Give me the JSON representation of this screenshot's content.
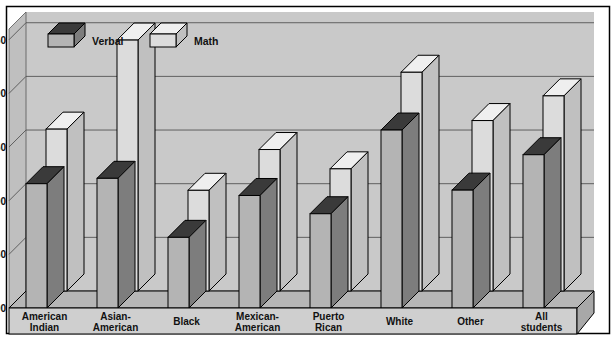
{
  "chart_data": {
    "type": "bar",
    "title": "",
    "subtitle": "",
    "xlabel": "",
    "ylabel": "",
    "ylim": [
      300,
      560
    ],
    "yticks": [
      300,
      350,
      400,
      450,
      500,
      550
    ],
    "ytick_labels": [
      "300",
      "350",
      "400",
      "450",
      "500",
      "550"
    ],
    "grid": true,
    "legend_position": "top-left",
    "style": "3d-block-bars",
    "categories": [
      "American\nIndian",
      "Asian-\nAmerican",
      "Black",
      "Mexican-\nAmerican",
      "Puerto\nRican",
      "White",
      "Other",
      "All\nstudents"
    ],
    "category_labels": [
      [
        "American",
        "Indian"
      ],
      [
        "Asian-",
        "American"
      ],
      [
        "Black",
        ""
      ],
      [
        "Mexican-",
        "American"
      ],
      [
        "Puerto",
        "Rican"
      ],
      [
        "White",
        ""
      ],
      [
        "Other",
        ""
      ],
      [
        "All",
        "students"
      ]
    ],
    "series": [
      {
        "name": "Verbal",
        "color": "#9a9a9a",
        "values": [
          400,
          405,
          350,
          389,
          372,
          450,
          394,
          427
        ]
      },
      {
        "name": "Math",
        "color": "#d6d6d6",
        "values": [
          435,
          518,
          378,
          416,
          398,
          488,
          443,
          466
        ]
      }
    ]
  },
  "legend": {
    "items": [
      {
        "label": "Verbal",
        "swatch": "dark-block-icon"
      },
      {
        "label": "Math",
        "swatch": "light-block-icon"
      }
    ]
  },
  "colors": {
    "plot_background": "#c9c9c9",
    "page_background": "#ffffff",
    "gridline": "#555555",
    "frame": "#000000",
    "bar_verbal_front": "#b4b4b4",
    "bar_verbal_side": "#7d7d7d",
    "bar_verbal_top": "#3a3a3a",
    "bar_math_front": "#dcdcdc",
    "bar_math_side": "#c0c0c0",
    "bar_math_top": "#efefef",
    "floor": "#bdbdbd",
    "floor_front": "#d0d0d0",
    "text": "#111111"
  }
}
